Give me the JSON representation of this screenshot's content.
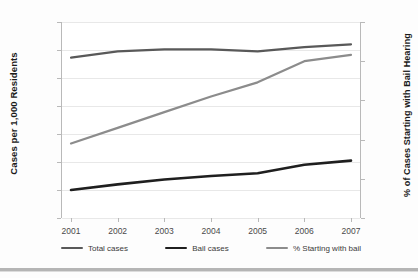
{
  "chart_data": {
    "type": "line",
    "title": "",
    "xlabel": "",
    "ylabel": "Cases per 1,000 Residents",
    "y2label": "% of Cases Starting with Bail Hearing",
    "categories": [
      "2001",
      "2002",
      "2003",
      "2004",
      "2005",
      "2006",
      "2007"
    ],
    "ylim": [
      4,
      18
    ],
    "y2lim": [
      30,
      55
    ],
    "yticks": [
      4,
      6,
      8,
      10,
      12,
      14,
      16,
      18
    ],
    "y2ticks": [
      30,
      35,
      40,
      45,
      50,
      55
    ],
    "grid": true,
    "legend_position": "bottom",
    "series": [
      {
        "name": "Total cases",
        "axis": "left",
        "color": "#595959",
        "values": [
          15.45,
          15.9,
          16.05,
          16.05,
          15.9,
          16.2,
          16.4
        ]
      },
      {
        "name": "Bail cases",
        "axis": "left",
        "color": "#1f1f1f",
        "values": [
          6.0,
          6.4,
          6.75,
          7.0,
          7.2,
          7.8,
          8.1
        ]
      },
      {
        "name": "% Starting with bail",
        "axis": "right",
        "color": "#8c8c8c",
        "values": [
          39.5,
          41.5,
          43.5,
          45.5,
          47.3,
          50.0,
          50.8
        ]
      }
    ]
  },
  "axes": {
    "left_title": "Cases per 1,000 Residents",
    "right_title": "% of Cases Starting with Bail Hearing",
    "left_ticks": [
      "18",
      "16",
      "14",
      "12",
      "10",
      "8",
      "6",
      "4"
    ],
    "right_ticks": [
      "55",
      "50",
      "45",
      "40",
      "35",
      "30"
    ],
    "x_ticks": [
      "2001",
      "2002",
      "2003",
      "2004",
      "2005",
      "2006",
      "2007"
    ]
  },
  "legend": {
    "items": [
      {
        "label": "Total cases",
        "color": "#595959"
      },
      {
        "label": "Bail cases",
        "color": "#1f1f1f"
      },
      {
        "label": "% Starting with bail",
        "color": "#8c8c8c"
      }
    ]
  },
  "colors": {
    "grid": "#e8e8e8",
    "axis": "#b9b9b9",
    "tick_text": "#4a4a4a",
    "title_text": "#1a1a1a"
  }
}
